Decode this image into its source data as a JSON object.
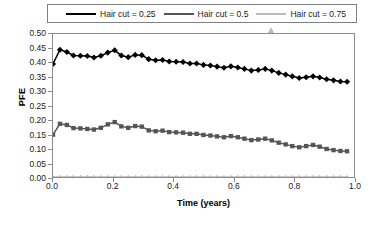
{
  "chart_data": {
    "type": "line",
    "title": "",
    "xlabel": "Time (years)",
    "ylabel": "PFE",
    "xlim": [
      0.0,
      1.0
    ],
    "ylim": [
      0.0,
      0.5
    ],
    "grid": false,
    "legend_position": "top",
    "xticks": [
      "0.0",
      "0.2",
      "0.4",
      "0.6",
      "0.8",
      "1.0"
    ],
    "xtick_values": [
      0.0,
      0.2,
      0.4,
      0.6,
      0.8,
      1.0
    ],
    "yticks": [
      "0.00",
      "0.05",
      "0.10",
      "0.15",
      "0.20",
      "0.25",
      "0.30",
      "0.35",
      "0.40",
      "0.45",
      "0.50"
    ],
    "ytick_values": [
      0.0,
      0.05,
      0.1,
      0.15,
      0.2,
      0.25,
      0.3,
      0.35,
      0.4,
      0.45,
      0.5
    ],
    "x": [
      0.0,
      0.023,
      0.046,
      0.068,
      0.091,
      0.114,
      0.136,
      0.159,
      0.182,
      0.205,
      0.227,
      0.25,
      0.273,
      0.295,
      0.318,
      0.341,
      0.364,
      0.386,
      0.409,
      0.432,
      0.455,
      0.477,
      0.5,
      0.523,
      0.545,
      0.568,
      0.591,
      0.614,
      0.636,
      0.659,
      0.682,
      0.705,
      0.727,
      0.75,
      0.773,
      0.795,
      0.818,
      0.841,
      0.864,
      0.886,
      0.909,
      0.932,
      0.955,
      0.977
    ],
    "series": [
      {
        "name": "Hair cut = 0.25",
        "color": "#000000",
        "marker": "diamond",
        "values": [
          0.395,
          0.445,
          0.437,
          0.425,
          0.424,
          0.423,
          0.418,
          0.424,
          0.435,
          0.443,
          0.425,
          0.419,
          0.427,
          0.426,
          0.412,
          0.408,
          0.409,
          0.404,
          0.403,
          0.402,
          0.397,
          0.397,
          0.392,
          0.39,
          0.386,
          0.382,
          0.387,
          0.383,
          0.378,
          0.372,
          0.374,
          0.378,
          0.372,
          0.364,
          0.358,
          0.352,
          0.346,
          0.349,
          0.352,
          0.348,
          0.342,
          0.338,
          0.334,
          0.333
        ]
      },
      {
        "name": "Hair cut = 0.5",
        "color": "#555555",
        "marker": "square",
        "values": [
          0.148,
          0.186,
          0.182,
          0.171,
          0.17,
          0.168,
          0.166,
          0.172,
          0.184,
          0.192,
          0.177,
          0.172,
          0.178,
          0.176,
          0.163,
          0.16,
          0.162,
          0.157,
          0.156,
          0.155,
          0.151,
          0.151,
          0.147,
          0.145,
          0.142,
          0.139,
          0.143,
          0.139,
          0.134,
          0.129,
          0.131,
          0.134,
          0.128,
          0.12,
          0.114,
          0.108,
          0.104,
          0.108,
          0.112,
          0.106,
          0.098,
          0.094,
          0.091,
          0.09
        ]
      },
      {
        "name": "Hair cut = 0.75",
        "color": "#bbbbbb",
        "marker": "triangle",
        "values": [
          0.0,
          0.0,
          0.0,
          0.0,
          0.0,
          0.0,
          0.0,
          0.0,
          0.0,
          0.0,
          0.0,
          0.0,
          0.0,
          0.0,
          0.0,
          0.0,
          0.0,
          0.0,
          0.0,
          0.0,
          0.0,
          0.0,
          0.0,
          0.0,
          0.0,
          0.0,
          0.0,
          0.0,
          0.0,
          0.0,
          0.0,
          0.0,
          0.0,
          0.0,
          0.0,
          0.0,
          0.0,
          0.0,
          0.0,
          0.0,
          0.0,
          0.0,
          0.0,
          0.0
        ]
      }
    ]
  },
  "legend": {
    "entries": [
      {
        "label": "Hair cut = 0.25"
      },
      {
        "label": "Hair cut = 0.5"
      },
      {
        "label": "Hair cut = 0.75"
      }
    ]
  },
  "axes": {
    "y_title": "PFE",
    "x_title": "Time (years)"
  }
}
